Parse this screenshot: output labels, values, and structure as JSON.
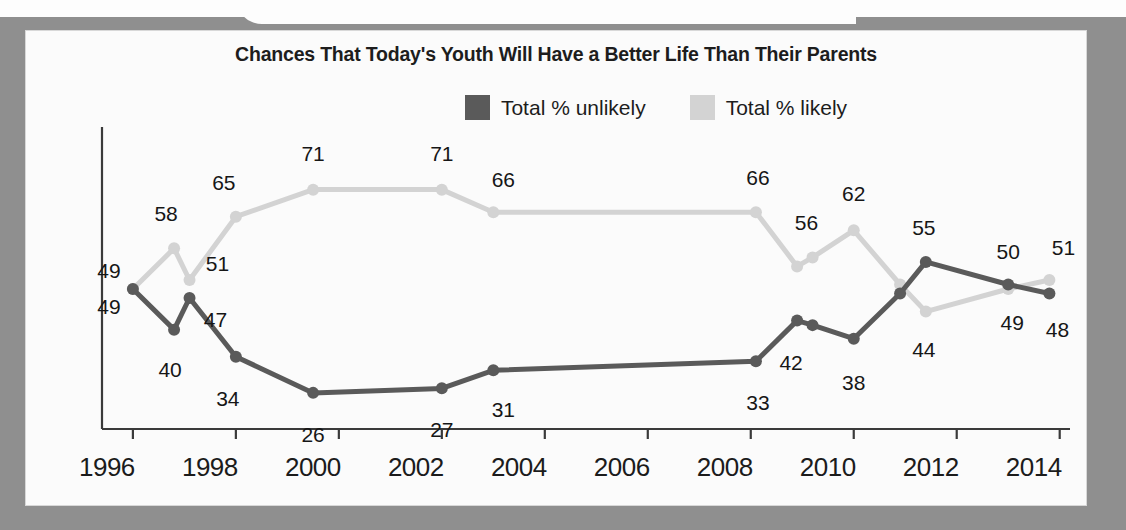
{
  "chart_data": {
    "type": "line",
    "title": "Chances That Today's Youth Will Have a Better Life Than Their Parents",
    "xlabel": "",
    "ylabel": "",
    "xlim": [
      1995.4,
      2014.2
    ],
    "ylim": [
      18,
      80
    ],
    "grid": false,
    "legend_position": "top-right",
    "xticks": [
      "1996",
      "1998",
      "2000",
      "2002",
      "2004",
      "2006",
      "2008",
      "2010",
      "2012",
      "2014"
    ],
    "series": [
      {
        "name": "Total % unlikely",
        "color": "#5a5a5a",
        "points": [
          {
            "x": 1996.0,
            "y": 49,
            "label": "49"
          },
          {
            "x": 1996.8,
            "y": 40,
            "label": "40"
          },
          {
            "x": 1997.1,
            "y": 47,
            "label": "47"
          },
          {
            "x": 1998.0,
            "y": 34,
            "label": "34"
          },
          {
            "x": 1999.5,
            "y": 26,
            "label": "26"
          },
          {
            "x": 2002.0,
            "y": 27,
            "label": "27"
          },
          {
            "x": 2003.0,
            "y": 31,
            "label": "31"
          },
          {
            "x": 2008.1,
            "y": 33,
            "label": "33"
          },
          {
            "x": 2008.9,
            "y": 42,
            "label": "42"
          },
          {
            "x": 2009.2,
            "y": 41,
            "label": ""
          },
          {
            "x": 2010.0,
            "y": 38,
            "label": "38"
          },
          {
            "x": 2010.9,
            "y": 48,
            "label": ""
          },
          {
            "x": 2011.4,
            "y": 55,
            "label": "55"
          },
          {
            "x": 2013.0,
            "y": 50,
            "label": "50"
          },
          {
            "x": 2013.8,
            "y": 48,
            "label": "48"
          }
        ]
      },
      {
        "name": "Total % likely",
        "color": "#d3d3d3",
        "points": [
          {
            "x": 1996.0,
            "y": 49,
            "label": "49"
          },
          {
            "x": 1996.8,
            "y": 58,
            "label": "58"
          },
          {
            "x": 1997.1,
            "y": 51,
            "label": "51"
          },
          {
            "x": 1998.0,
            "y": 65,
            "label": "65"
          },
          {
            "x": 1999.5,
            "y": 71,
            "label": "71"
          },
          {
            "x": 2002.0,
            "y": 71,
            "label": "71"
          },
          {
            "x": 2003.0,
            "y": 66,
            "label": "66"
          },
          {
            "x": 2008.1,
            "y": 66,
            "label": "66"
          },
          {
            "x": 2008.9,
            "y": 54,
            "label": ""
          },
          {
            "x": 2009.2,
            "y": 56,
            "label": "56"
          },
          {
            "x": 2010.0,
            "y": 62,
            "label": "62"
          },
          {
            "x": 2010.9,
            "y": 50,
            "label": ""
          },
          {
            "x": 2011.4,
            "y": 44,
            "label": "44"
          },
          {
            "x": 2013.0,
            "y": 49,
            "label": "49"
          },
          {
            "x": 2013.8,
            "y": 51,
            "label": "51"
          }
        ]
      }
    ]
  },
  "legend": {
    "items": [
      {
        "label": "Total % unlikely",
        "color": "#5a5a5a"
      },
      {
        "label": "Total % likely",
        "color": "#d3d3d3"
      }
    ]
  },
  "source_note": "SOURCE: September/October 1996"
}
